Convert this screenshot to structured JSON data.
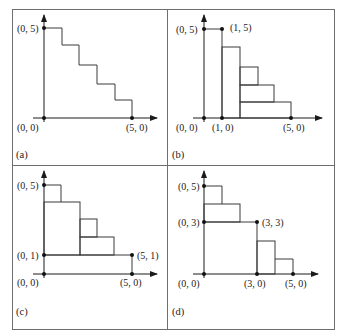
{
  "figure": {
    "panels": [
      {
        "id": "a",
        "label": "(a)",
        "points": [
          {
            "label": "(0, 5)",
            "x": 0,
            "y": 5
          },
          {
            "label": "(0, 0)",
            "x": 0,
            "y": 0
          },
          {
            "label": "(5, 0)",
            "x": 5,
            "y": 0
          }
        ],
        "description": "Staircase from (0,5) down to (5,0) with five steps"
      },
      {
        "id": "b",
        "label": "(b)",
        "points": [
          {
            "label": "(0, 5)",
            "x": 0,
            "y": 5
          },
          {
            "label": "(1, 5)",
            "x": 1,
            "y": 5
          },
          {
            "label": "(0, 0)",
            "x": 0,
            "y": 0
          },
          {
            "label": "(1, 0)",
            "x": 1,
            "y": 0
          },
          {
            "label": "(5, 0)",
            "x": 5,
            "y": 0
          }
        ],
        "description": "Vertical strip from x=0 to 1 of height 5, remaining staircase decomposed into rectangles"
      },
      {
        "id": "c",
        "label": "(c)",
        "points": [
          {
            "label": "(0, 5)",
            "x": 0,
            "y": 5
          },
          {
            "label": "(0, 1)",
            "x": 0,
            "y": 1
          },
          {
            "label": "(5, 1)",
            "x": 5,
            "y": 1
          },
          {
            "label": "(0, 0)",
            "x": 0,
            "y": 0
          },
          {
            "label": "(5, 0)",
            "x": 5,
            "y": 0
          }
        ],
        "description": "Horizontal strip from y=0 to 1 of width 5, remaining staircase decomposed into rectangles"
      },
      {
        "id": "d",
        "label": "(d)",
        "points": [
          {
            "label": "(0, 5)",
            "x": 0,
            "y": 5
          },
          {
            "label": "(0, 3)",
            "x": 0,
            "y": 3
          },
          {
            "label": "(3, 3)",
            "x": 3,
            "y": 3
          },
          {
            "label": "(0, 0)",
            "x": 0,
            "y": 0
          },
          {
            "label": "(3, 0)",
            "x": 3,
            "y": 0
          },
          {
            "label": "(5, 0)",
            "x": 5,
            "y": 0
          }
        ],
        "description": "Square 3x3 at origin, staircase split into upper-left and lower-right sub-staircases"
      }
    ]
  },
  "labels": {
    "a": {
      "p05": "(0, 5)",
      "p00": "(0, 0)",
      "p50": "(5, 0)",
      "panel": "(a)"
    },
    "b": {
      "p05": "(0, 5)",
      "p15": "(1, 5)",
      "p00": "(0, 0)",
      "p10": "(1, 0)",
      "p50": "(5, 0)",
      "panel": "(b)"
    },
    "c": {
      "p05": "(0, 5)",
      "p01": "(0, 1)",
      "p51": "(5, 1)",
      "p00": "(0, 0)",
      "p50": "(5, 0)",
      "panel": "(c)"
    },
    "d": {
      "p05": "(0, 5)",
      "p03": "(0, 3)",
      "p33": "(3, 3)",
      "p00": "(0, 0)",
      "p30": "(3, 0)",
      "p50": "(5, 0)",
      "panel": "(d)"
    }
  }
}
